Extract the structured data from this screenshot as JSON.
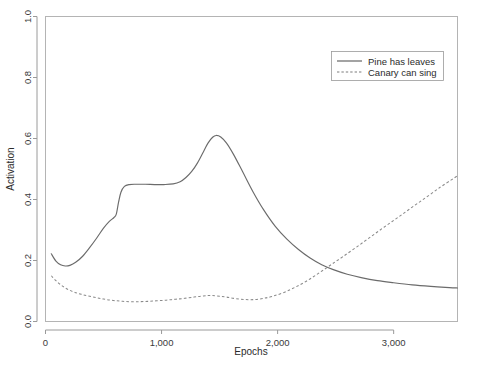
{
  "chart_data": {
    "type": "line",
    "title": "",
    "xlabel": "Epochs",
    "ylabel": "Activation",
    "xlim": [
      0,
      3550
    ],
    "ylim": [
      0.0,
      1.0
    ],
    "grid": false,
    "legend_position": "top-right",
    "xticks": [
      0,
      1000,
      2000,
      3000
    ],
    "xtick_labels": [
      "0",
      "1,000",
      "2,000",
      "3,000"
    ],
    "yticks": [
      0.0,
      0.2,
      0.4,
      0.6,
      0.8,
      1.0
    ],
    "ytick_labels": [
      "0.0",
      "0.2",
      "0.4",
      "0.6",
      "0.8",
      "1.0"
    ],
    "series": [
      {
        "name": "Pine has leaves",
        "style": "solid",
        "color": "#6b6b6b",
        "x": [
          50,
          90,
          130,
          170,
          210,
          260,
          320,
          380,
          440,
          500,
          550,
          590,
          610,
          630,
          650,
          680,
          720,
          780,
          860,
          940,
          1020,
          1100,
          1160,
          1210,
          1260,
          1310,
          1360,
          1400,
          1440,
          1470,
          1510,
          1560,
          1620,
          1700,
          1790,
          1880,
          1980,
          2080,
          2180,
          2280,
          2380,
          2480,
          2600,
          2720,
          2860,
          3000,
          3160,
          3320,
          3480,
          3550
        ],
        "y": [
          0.222,
          0.198,
          0.186,
          0.182,
          0.184,
          0.194,
          0.214,
          0.242,
          0.273,
          0.306,
          0.328,
          0.341,
          0.352,
          0.392,
          0.424,
          0.443,
          0.449,
          0.45,
          0.45,
          0.449,
          0.449,
          0.451,
          0.458,
          0.472,
          0.492,
          0.52,
          0.556,
          0.585,
          0.604,
          0.61,
          0.605,
          0.585,
          0.548,
          0.49,
          0.424,
          0.366,
          0.312,
          0.27,
          0.236,
          0.208,
          0.186,
          0.17,
          0.155,
          0.144,
          0.134,
          0.127,
          0.12,
          0.115,
          0.111,
          0.11
        ]
      },
      {
        "name": "Canary can sing",
        "style": "dashed",
        "color": "#8a8a8a",
        "x": [
          50,
          90,
          140,
          190,
          250,
          320,
          400,
          480,
          560,
          640,
          720,
          800,
          880,
          960,
          1040,
          1120,
          1200,
          1280,
          1340,
          1400,
          1440,
          1500,
          1560,
          1640,
          1720,
          1800,
          1880,
          1960,
          2060,
          2160,
          2260,
          2360,
          2460,
          2560,
          2680,
          2800,
          2920,
          3040,
          3160,
          3280,
          3400,
          3500,
          3550
        ],
        "y": [
          0.15,
          0.134,
          0.118,
          0.106,
          0.096,
          0.088,
          0.081,
          0.075,
          0.07,
          0.067,
          0.065,
          0.065,
          0.066,
          0.068,
          0.07,
          0.073,
          0.076,
          0.08,
          0.083,
          0.085,
          0.085,
          0.083,
          0.08,
          0.075,
          0.072,
          0.072,
          0.076,
          0.083,
          0.096,
          0.114,
          0.135,
          0.16,
          0.186,
          0.212,
          0.244,
          0.277,
          0.31,
          0.342,
          0.375,
          0.407,
          0.44,
          0.465,
          0.478
        ]
      }
    ],
    "annotations": {
      "crossover_epoch": 2350,
      "crossover_activation": 0.155
    }
  },
  "legend": {
    "entries": [
      {
        "label": "Pine has leaves",
        "style": "solid"
      },
      {
        "label": "Canary can sing",
        "style": "dashed"
      }
    ]
  },
  "axes": {
    "x_title": "Epochs",
    "y_title": "Activation"
  }
}
